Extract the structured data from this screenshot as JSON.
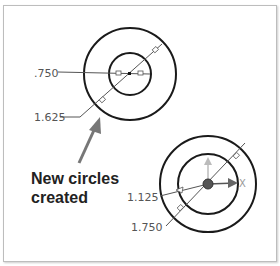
{
  "diagram": {
    "top_assembly": {
      "dimensions": [
        ".750",
        "1.625"
      ]
    },
    "bottom_assembly": {
      "dimensions": [
        "1.125",
        "1.750"
      ]
    },
    "annotation": {
      "line1": "New circles",
      "line2": "created"
    },
    "colors": {
      "stroke": "#1a1a1a",
      "arrow": "#777777",
      "dim_text": "#555555"
    }
  }
}
